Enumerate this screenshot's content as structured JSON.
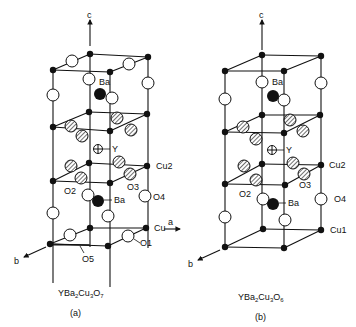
{
  "figure": {
    "panels": [
      {
        "id": "a",
        "formula": {
          "base": "YBa",
          "s1": "2",
          "mid": "Cu",
          "s2": "3",
          "end": "O",
          "s3": "7"
        },
        "caption": "(a)",
        "axis_labels": {
          "c": "c",
          "a": "a",
          "b": "b"
        },
        "atom_labels": {
          "ba_top": "Ba",
          "y": "Y",
          "cu2": "Cu2",
          "o2": "O2",
          "o3": "O3",
          "ba_bottom": "Ba",
          "o4": "O4",
          "cu": "Cu",
          "o1": "O1",
          "o5": "O5"
        }
      },
      {
        "id": "b",
        "formula": {
          "base": "YBa",
          "s1": "2",
          "mid": "Cu",
          "s2": "3",
          "end": "O",
          "s3": "6"
        },
        "caption": "(b)",
        "axis_labels": {
          "c": "c",
          "b": "b"
        },
        "atom_labels": {
          "ba_top": "Ba",
          "y": "Y",
          "cu2": "Cu2",
          "o2": "O2",
          "o3": "O3",
          "ba_bottom": "Ba",
          "o4": "O4",
          "cu1": "Cu1"
        }
      }
    ],
    "legend_symbols": {
      "cu": "filled small circle",
      "o": "open circle",
      "o_plane": "hatched circle",
      "ba": "large filled circle",
      "y": "crossed circle"
    }
  }
}
